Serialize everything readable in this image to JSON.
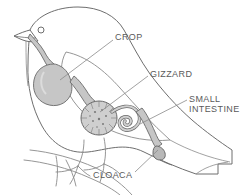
{
  "diagram": {
    "background_color": "#ffffff",
    "outline_color": "#6e6e6e",
    "organ_fill_color": "#c6c6c6",
    "organ_fill_light": "#d8d8d8",
    "organ_stroke_color": "#6a6a6a",
    "leader_line_color": "#8a8a8a",
    "label_color": "#5a5a5a",
    "labels": [
      {
        "id": "crop",
        "text": "CROP",
        "lines": [
          "CROP"
        ],
        "x": 115,
        "y": 32,
        "leader": {
          "x1": 113,
          "y1": 40,
          "x2": 60,
          "y2": 80
        }
      },
      {
        "id": "gizzard",
        "text": "GIZZARD",
        "lines": [
          "GIZZARD"
        ],
        "x": 150,
        "y": 69,
        "leader": {
          "x1": 148,
          "y1": 76,
          "x2": 100,
          "y2": 112
        }
      },
      {
        "id": "small-intestine",
        "text": "SMALL INTESTINE",
        "lines": [
          "SMALL",
          "INTESTINE"
        ],
        "x": 189,
        "y": 94,
        "leader": {
          "x1": 187,
          "y1": 100,
          "x2": 140,
          "y2": 124
        }
      },
      {
        "id": "cloaca",
        "text": "CLOACA",
        "lines": [
          "CLOACA"
        ],
        "x": 93,
        "y": 170,
        "leader": {
          "x1": 135,
          "y1": 172,
          "x2": 150,
          "y2": 140
        }
      }
    ],
    "organs": [
      {
        "id": "esophagus",
        "name": "esophagus"
      },
      {
        "id": "crop",
        "name": "crop"
      },
      {
        "id": "proventriculus",
        "name": "proventriculus"
      },
      {
        "id": "gizzard",
        "name": "gizzard"
      },
      {
        "id": "small-intestine",
        "name": "small-intestine"
      },
      {
        "id": "cloaca",
        "name": "cloaca"
      }
    ],
    "bird_parts": [
      {
        "id": "body",
        "name": "bird-body-outline"
      },
      {
        "id": "head",
        "name": "bird-head-outline"
      },
      {
        "id": "beak",
        "name": "bird-beak"
      },
      {
        "id": "eye",
        "name": "bird-eye"
      },
      {
        "id": "wing",
        "name": "bird-wing-outline"
      },
      {
        "id": "tail",
        "name": "bird-tail"
      },
      {
        "id": "legs",
        "name": "bird-legs-and-feet"
      },
      {
        "id": "perch",
        "name": "branch-perch"
      }
    ]
  }
}
